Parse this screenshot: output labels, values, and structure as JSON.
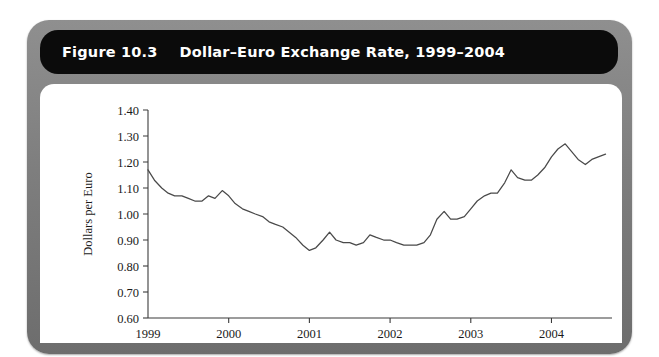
{
  "figure": {
    "number_label": "Figure 10.3",
    "title": "Dollar–Euro Exchange Rate, 1999–2004"
  },
  "colors": {
    "frame": "#7e7e7e",
    "title_bar": "#0b0b0b",
    "title_text": "#ffffff",
    "panel": "#ffffff",
    "line": "#4a4a4a",
    "axis": "#3b3b3b"
  },
  "chart_data": {
    "type": "line",
    "title": "Dollar–Euro Exchange Rate, 1999–2004",
    "xlabel": "",
    "ylabel": "Dollars per Euro",
    "xlim": [
      1999.0,
      2004.75
    ],
    "ylim": [
      0.6,
      1.4
    ],
    "grid": false,
    "legend": "none",
    "ytick_labels": [
      "1.40",
      "1.30",
      "1.20",
      "1.10",
      "1.00",
      "0.90",
      "0.80",
      "0.70",
      "0.60"
    ],
    "ytick_values": [
      1.4,
      1.3,
      1.2,
      1.1,
      1.0,
      0.9,
      0.8,
      0.7,
      0.6
    ],
    "xtick_labels": [
      "1999",
      "2000",
      "2001",
      "2002",
      "2003",
      "2004"
    ],
    "xtick_values": [
      1999,
      2000,
      2001,
      2002,
      2003,
      2004
    ],
    "series": [
      {
        "name": "Dollars per Euro",
        "x": [
          1999.0,
          1999.08,
          1999.17,
          1999.25,
          1999.33,
          1999.42,
          1999.5,
          1999.58,
          1999.67,
          1999.75,
          1999.83,
          1999.92,
          2000.0,
          2000.08,
          2000.17,
          2000.25,
          2000.33,
          2000.42,
          2000.5,
          2000.58,
          2000.67,
          2000.75,
          2000.83,
          2000.92,
          2001.0,
          2001.08,
          2001.17,
          2001.25,
          2001.33,
          2001.42,
          2001.5,
          2001.58,
          2001.67,
          2001.75,
          2001.83,
          2001.92,
          2002.0,
          2002.08,
          2002.17,
          2002.25,
          2002.33,
          2002.42,
          2002.5,
          2002.58,
          2002.67,
          2002.75,
          2002.83,
          2002.92,
          2003.0,
          2003.08,
          2003.17,
          2003.25,
          2003.33,
          2003.42,
          2003.5,
          2003.58,
          2003.67,
          2003.75,
          2003.83,
          2003.92,
          2004.0,
          2004.08,
          2004.17,
          2004.25,
          2004.33,
          2004.42,
          2004.5,
          2004.58,
          2004.67
        ],
        "values": [
          1.17,
          1.13,
          1.1,
          1.08,
          1.07,
          1.07,
          1.06,
          1.05,
          1.05,
          1.07,
          1.06,
          1.09,
          1.07,
          1.04,
          1.02,
          1.01,
          1.0,
          0.99,
          0.97,
          0.96,
          0.95,
          0.93,
          0.91,
          0.88,
          0.86,
          0.87,
          0.9,
          0.93,
          0.9,
          0.89,
          0.89,
          0.88,
          0.89,
          0.92,
          0.91,
          0.9,
          0.9,
          0.89,
          0.88,
          0.88,
          0.88,
          0.89,
          0.92,
          0.98,
          1.01,
          0.98,
          0.98,
          0.99,
          1.02,
          1.05,
          1.07,
          1.08,
          1.08,
          1.12,
          1.17,
          1.14,
          1.13,
          1.13,
          1.15,
          1.18,
          1.22,
          1.25,
          1.27,
          1.24,
          1.21,
          1.19,
          1.21,
          1.22,
          1.23
        ]
      }
    ]
  }
}
